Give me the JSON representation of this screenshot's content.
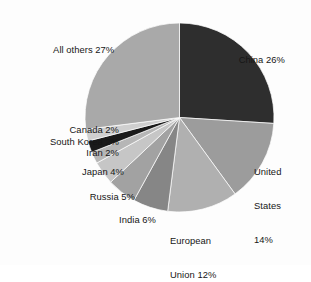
{
  "chart_data": {
    "type": "pie",
    "title": "",
    "subtitle": "",
    "xlabel": "",
    "ylabel": "",
    "legend_position": "none",
    "grid": false,
    "units": "percent",
    "start_angle_deg": 0,
    "direction": "clockwise",
    "categories": [
      "China",
      "United States",
      "European Union",
      "India",
      "Russia",
      "Japan",
      "Iran",
      "South Korea",
      "Canada",
      "All others"
    ],
    "values": [
      26,
      14,
      12,
      6,
      5,
      4,
      2,
      2,
      2,
      27
    ],
    "colors": [
      "#2e2e2e",
      "#9c9c9c",
      "#b0b0b0",
      "#868686",
      "#a2a2a2",
      "#c6c6c6",
      "#b6b6b6",
      "#1a1a1a",
      "#cfcfcf",
      "#a9a9a9"
    ],
    "slices": [
      {
        "label": "China 26%",
        "name": "China",
        "value": 26,
        "color": "#2e2e2e"
      },
      {
        "label": "United\nStates\n14%",
        "name": "United States",
        "value": 14,
        "color": "#9c9c9c"
      },
      {
        "label": "European\nUnion 12%",
        "name": "European Union",
        "value": 12,
        "color": "#b0b0b0"
      },
      {
        "label": "India 6%",
        "name": "India",
        "value": 6,
        "color": "#868686"
      },
      {
        "label": "Russia 5%",
        "name": "Russia",
        "value": 5,
        "color": "#a2a2a2"
      },
      {
        "label": "Japan 4%",
        "name": "Japan",
        "value": 4,
        "color": "#c6c6c6"
      },
      {
        "label": "Iran 2%",
        "name": "Iran",
        "value": 2,
        "color": "#b6b6b6"
      },
      {
        "label": "South Korea 2%",
        "name": "South Korea",
        "value": 2,
        "color": "#1a1a1a"
      },
      {
        "label": "Canada 2%",
        "name": "Canada",
        "value": 2,
        "color": "#cfcfcf"
      },
      {
        "label": "All others 27%",
        "name": "All others",
        "value": 27,
        "color": "#a9a9a9"
      }
    ]
  },
  "labels": {
    "china": "China 26%",
    "united_states_l1": "United",
    "united_states_l2": "States",
    "united_states_l3": "14%",
    "european_union_l1": "European",
    "european_union_l2": "Union 12%",
    "india": "India 6%",
    "russia": "Russia 5%",
    "japan": "Japan 4%",
    "iran": "Iran 2%",
    "south_korea": "South Korea 2%",
    "canada": "Canada 2%",
    "all_others": "All others 27%"
  },
  "style": {
    "background": "#fdfdfd",
    "text_color": "#161616",
    "slice_stroke": "#ffffff"
  }
}
